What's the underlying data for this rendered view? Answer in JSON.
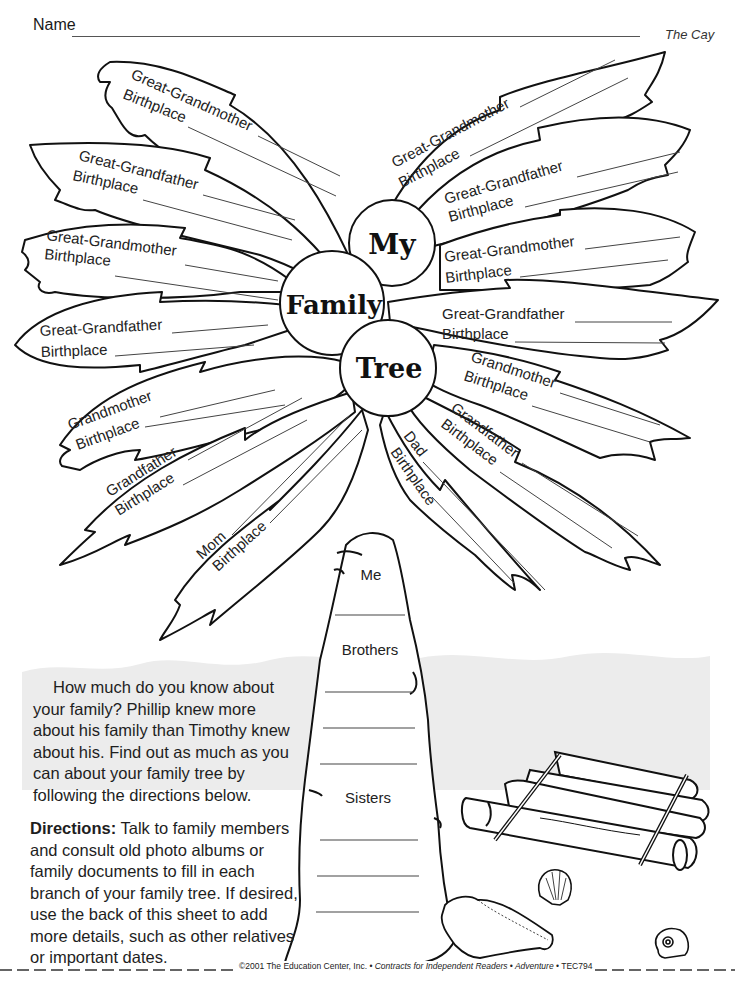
{
  "header": {
    "name_label": "Name",
    "book_title": "The Cay"
  },
  "title_circles": {
    "my": "My",
    "family": "Family",
    "tree": "Tree"
  },
  "leaves": {
    "left": [
      {
        "line1": "Great-Grandmother",
        "line2": "Birthplace"
      },
      {
        "line1": "Great-Grandfather",
        "line2": "Birthplace"
      },
      {
        "line1": "Great-Grandmother",
        "line2": "Birthplace"
      },
      {
        "line1": "Great-Grandfather",
        "line2": "Birthplace"
      },
      {
        "line1": "Grandmother",
        "line2": "Birthplace"
      },
      {
        "line1": "Grandfather",
        "line2": "Birthplace"
      },
      {
        "line1": "Mom",
        "line2": "Birthplace"
      }
    ],
    "right": [
      {
        "line1": "Great-Grandmother",
        "line2": "Birthplace"
      },
      {
        "line1": "Great-Grandfather",
        "line2": "Birthplace"
      },
      {
        "line1": "Great-Grandmother",
        "line2": "Birthplace"
      },
      {
        "line1": "Great-Grandfather",
        "line2": "Birthplace"
      },
      {
        "line1": "Grandmother",
        "line2": "Birthplace"
      },
      {
        "line1": "Grandfather",
        "line2": "Birthplace"
      },
      {
        "line1": "Dad",
        "line2": "Birthplace"
      }
    ]
  },
  "trunk": {
    "me": "Me",
    "brothers": "Brothers",
    "sisters": "Sisters"
  },
  "intro": {
    "text": "How much do you know about your family? Phillip knew more about his family than Timothy knew about his. Find out as much as you can about your family tree by following the directions below."
  },
  "directions": {
    "label": "Directions:",
    "text": " Talk to family members and consult old photo albums or family documents to fill in each branch of your family tree. If desired, use the back of this sheet to add more details, such as other relatives or important dates."
  },
  "footer": {
    "copyright": "©2001 The Education Center, Inc. • ",
    "series": "Contracts for Independent Readers • Adventure",
    "code": " •  TEC794"
  },
  "colors": {
    "ink": "#111111",
    "sea": "#ececec",
    "paper": "#ffffff"
  }
}
